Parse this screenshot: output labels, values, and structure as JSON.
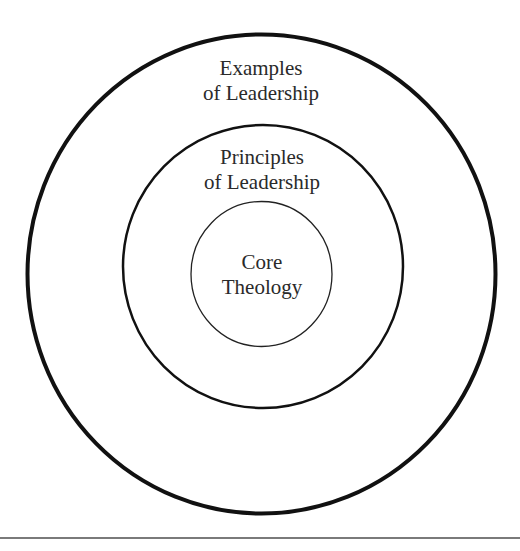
{
  "diagram": {
    "type": "concentric-circles",
    "rings": [
      {
        "id": "outer",
        "line1": "Examples",
        "line2": "of Leadership",
        "cx": 261,
        "cy": 274,
        "rx": 234,
        "ry": 240,
        "stroke": "#111111",
        "stroke_width": 4
      },
      {
        "id": "middle",
        "line1": "Principles",
        "line2": "of Leadership",
        "cx": 263,
        "cy": 266,
        "rx": 140,
        "ry": 141,
        "stroke": "#111111",
        "stroke_width": 2.5
      },
      {
        "id": "inner",
        "line1": "Core",
        "line2": "Theology",
        "cx": 261,
        "cy": 274,
        "rx": 71,
        "ry": 73,
        "stroke": "#222222",
        "stroke_width": 1.3
      }
    ]
  },
  "colors": {
    "background": "#ffffff",
    "text": "#2a2a2a",
    "rule": "#7a7a7a"
  }
}
